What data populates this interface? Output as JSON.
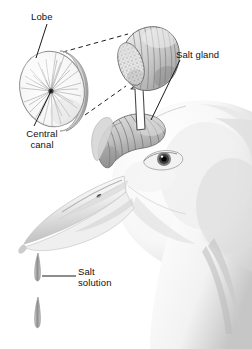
{
  "figure": {
    "background_color": "#ffffff"
  },
  "labels": {
    "lobe": "Lobe",
    "central_canal": "Central\ncanal",
    "salt_gland": "Salt gland",
    "salt_solution": "Salt\nsolution"
  },
  "parts": {
    "lobe_cross_section": "lobe-cross-section-disc",
    "enlarged_gland": "enlarged-salt-gland",
    "bird_head": "bird-head-profile",
    "eye": "bird-eye",
    "beak": "tube-nosed-beak",
    "gland_on_head": "salt-gland-on-head",
    "droplets": "salt-solution-droplets"
  },
  "colors": {
    "ink": "#111111",
    "outline": "#6b6b6b",
    "gland_fill": "#c9c9c9",
    "gland_shadow": "#9a9a9a",
    "head_light": "#fbfbfb",
    "head_shadow": "#d8d8d8",
    "lobe_fill": "#f4f4f4",
    "lobe_rim": "#cfcfcf",
    "dashed": "#222222",
    "droplet": "#9d9d9d"
  },
  "leader_lines": {
    "lobe_leader": "line from Lobe label to disc rim",
    "central_canal_leader": "line from Central canal label to disc centre",
    "salt_gland_leader": "line from Salt gland label to gland on head",
    "salt_solution_leader": "line from Salt solution label to droplet",
    "magnify_dashes": "two dashed lines linking enlarged gland to lobe disc",
    "white_arrow": "outlined arrow from head gland up to enlarged gland"
  }
}
